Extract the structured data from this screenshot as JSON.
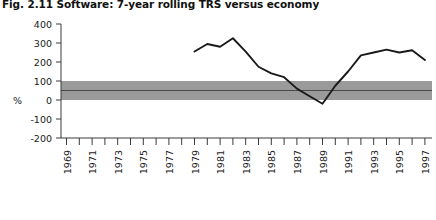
{
  "figure": {
    "title": "Fig. 2.11  Software: 7-year rolling TRS versus economy",
    "axis_unit_label": "%"
  },
  "chart_data": {
    "type": "line",
    "title": "Fig. 2.11  Software: 7-year rolling TRS versus economy",
    "xlabel": "",
    "ylabel": "%",
    "ylim": [
      -200,
      400
    ],
    "xlim": [
      1969,
      1998
    ],
    "ytick_labels": [
      "400",
      "300",
      "200",
      "100",
      "0",
      "-100",
      "-200"
    ],
    "yticks": [
      400,
      300,
      200,
      100,
      0,
      -100,
      -200
    ],
    "xtick_labels": [
      "1969",
      "1971",
      "1973",
      "1975",
      "1977",
      "1979",
      "1981",
      "1983",
      "1985",
      "1987",
      "1989",
      "1991",
      "1993",
      "1995",
      "1997"
    ],
    "xticks": [
      1969,
      1971,
      1973,
      1975,
      1977,
      1979,
      1981,
      1983,
      1985,
      1987,
      1989,
      1991,
      1993,
      1995,
      1997
    ],
    "xticks_minor": [
      1970,
      1972,
      1974,
      1976,
      1978,
      1980,
      1982,
      1984,
      1986,
      1988,
      1990,
      1992,
      1994,
      1996,
      1998
    ],
    "grid": false,
    "legend": "none",
    "series": [
      {
        "name": "Software 7-year rolling TRS",
        "color": "#1a1a1a",
        "x": [
          1979,
          1980,
          1981,
          1982,
          1983,
          1984,
          1985,
          1986,
          1987,
          1988,
          1989,
          1990,
          1991,
          1992,
          1993,
          1994,
          1995,
          1996,
          1997
        ],
        "values": [
          255,
          295,
          280,
          325,
          255,
          175,
          140,
          120,
          60,
          20,
          -20,
          75,
          150,
          235,
          250,
          265,
          250,
          262,
          210
        ]
      }
    ],
    "band": {
      "name": "Economy range",
      "color": "#9a9a9a",
      "y_low": 0,
      "y_high": 100,
      "median_line": 50,
      "median_color": "#4a4a4a"
    }
  }
}
